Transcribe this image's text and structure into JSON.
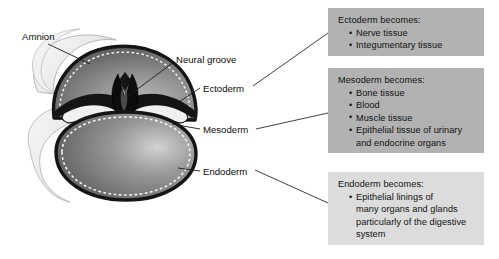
{
  "figure": {
    "background_color": "#ffffff",
    "diagram_labels": [
      {
        "id": "amnion",
        "text": "Amnion"
      },
      {
        "id": "neural-groove",
        "text": "Neural groove"
      },
      {
        "id": "ectoderm",
        "text": "Ectoderm"
      },
      {
        "id": "mesoderm",
        "text": "Mesoderm"
      },
      {
        "id": "endoderm",
        "text": "Endoderm"
      }
    ]
  },
  "boxes": {
    "ectoderm": {
      "heading": "Ectoderm becomes:",
      "background_color": "#b2b2b2",
      "items": [
        "Nerve tissue",
        "Integumentary tissue"
      ]
    },
    "mesoderm": {
      "heading": "Mesoderm becomes:",
      "background_color": "#b2b2b2",
      "items": [
        "Bone tissue",
        "Blood",
        "Muscle tissue",
        "Epithelial tissue of urinary\nand endocrine organs"
      ]
    },
    "endoderm": {
      "heading": "Endoderm becomes:",
      "background_color": "#dcdcdc",
      "items": [
        "Epithelial linings of\nmany organs and glands\nparticularly of the digestive\nsystem"
      ]
    }
  },
  "illustration": {
    "description": "Cross section of an early embryo showing the amniotic cavity above with the neural groove, and the yolk sac below, bounded by ectoderm, mesoderm and endoderm layers",
    "colors": {
      "amnion_membrane": "#e8e8e8",
      "ectoderm_layer": "#6e6e6e",
      "neural_groove": "#141414",
      "yolk_sac": "#7a7a7a",
      "outline": "#1a1a1a",
      "dashed_border": "#f4f4f4"
    }
  }
}
